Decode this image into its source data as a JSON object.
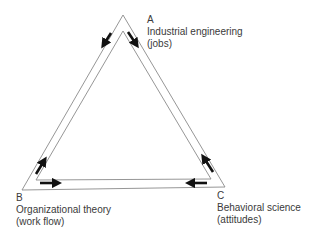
{
  "diagram": {
    "type": "triangle-flow",
    "nodes": [
      {
        "id": "A",
        "letter": "A",
        "title": "Industrial engineering",
        "subtitle": "(jobs)"
      },
      {
        "id": "B",
        "letter": "B",
        "title": "Organizational theory",
        "subtitle": "(work flow)"
      },
      {
        "id": "C",
        "letter": "C",
        "title": "Behavioral science",
        "subtitle": "(attitudes)"
      }
    ],
    "arrows": [
      {
        "from": "A",
        "to": "B",
        "position": "left-side-top"
      },
      {
        "from": "A",
        "to": "C",
        "position": "right-side-top"
      },
      {
        "from": "B",
        "to": "A",
        "position": "left-side-bottom"
      },
      {
        "from": "B",
        "to": "C",
        "position": "bottom-left"
      },
      {
        "from": "C",
        "to": "B",
        "position": "bottom-right"
      },
      {
        "from": "C",
        "to": "A",
        "position": "right-side-bottom"
      }
    ],
    "colors": {
      "line": "#8a8a8a",
      "arrow": "#111111",
      "text": "#3a3a3a"
    }
  }
}
